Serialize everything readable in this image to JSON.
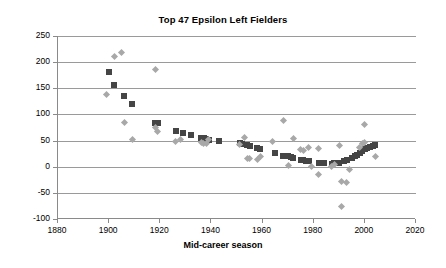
{
  "chart_data": {
    "type": "scatter",
    "title": "Top 47 Epsilon Left Fielders",
    "xlabel": "Mid-career season",
    "ylabel": "",
    "xlim": [
      1880,
      2020
    ],
    "ylim": [
      -100,
      250
    ],
    "xticks": [
      1880,
      1900,
      1920,
      1940,
      1960,
      1980,
      2000,
      2020
    ],
    "yticks": [
      -100,
      -50,
      0,
      50,
      100,
      150,
      200,
      250
    ],
    "grid": "horizontal",
    "legend": "none",
    "colors": {
      "series_squares": "#454545",
      "series_diamonds": "#a8a8a8",
      "gridline": "#9a9a9a",
      "axis": "#8a8a8a",
      "text": "#000000"
    },
    "series": [
      {
        "name": "smoothed-trend",
        "marker": "square",
        "color": "#454545",
        "points": [
          [
            1900,
            182
          ],
          [
            1902,
            157
          ],
          [
            1906,
            136
          ],
          [
            1909,
            120
          ],
          [
            1918,
            84
          ],
          [
            1919,
            83
          ],
          [
            1926,
            68
          ],
          [
            1929,
            64
          ],
          [
            1932,
            60
          ],
          [
            1936,
            55
          ],
          [
            1937,
            54
          ],
          [
            1938,
            53
          ],
          [
            1939,
            52
          ],
          [
            1943,
            50
          ],
          [
            1951,
            45
          ],
          [
            1952,
            44
          ],
          [
            1954,
            41
          ],
          [
            1955,
            40
          ],
          [
            1958,
            35
          ],
          [
            1959,
            34
          ],
          [
            1965,
            26
          ],
          [
            1968,
            21
          ],
          [
            1970,
            20
          ],
          [
            1971,
            18
          ],
          [
            1972,
            17
          ],
          [
            1975,
            13
          ],
          [
            1976,
            12
          ],
          [
            1977,
            11
          ],
          [
            1978,
            10
          ],
          [
            1982,
            8
          ],
          [
            1983,
            8
          ],
          [
            1984,
            7
          ],
          [
            1987,
            6
          ],
          [
            1988,
            7
          ],
          [
            1990,
            8
          ],
          [
            1992,
            10
          ],
          [
            1993,
            12
          ],
          [
            1995,
            17
          ],
          [
            1996,
            20
          ],
          [
            1997,
            23
          ],
          [
            1998,
            27
          ],
          [
            1999,
            30
          ],
          [
            2000,
            33
          ],
          [
            2001,
            35
          ],
          [
            2002,
            38
          ],
          [
            2003,
            40
          ],
          [
            2004,
            41
          ]
        ]
      },
      {
        "name": "raw-values",
        "marker": "diamond",
        "color": "#a8a8a8",
        "points": [
          [
            1899,
            139
          ],
          [
            1902,
            210
          ],
          [
            1905,
            218
          ],
          [
            1906,
            85
          ],
          [
            1909,
            52
          ],
          [
            1918,
            185
          ],
          [
            1918,
            75
          ],
          [
            1919,
            68
          ],
          [
            1926,
            48
          ],
          [
            1928,
            53
          ],
          [
            1936,
            47
          ],
          [
            1937,
            45
          ],
          [
            1938,
            44
          ],
          [
            1939,
            52
          ],
          [
            1951,
            43
          ],
          [
            1953,
            55
          ],
          [
            1954,
            16
          ],
          [
            1955,
            15
          ],
          [
            1958,
            14
          ],
          [
            1959,
            19
          ],
          [
            1964,
            48
          ],
          [
            1968,
            89
          ],
          [
            1970,
            3
          ],
          [
            1972,
            54
          ],
          [
            1975,
            32
          ],
          [
            1976,
            31
          ],
          [
            1978,
            37
          ],
          [
            1979,
            0
          ],
          [
            1982,
            35
          ],
          [
            1982,
            -15
          ],
          [
            1987,
            1
          ],
          [
            1988,
            5
          ],
          [
            1990,
            41
          ],
          [
            1991,
            -77
          ],
          [
            1991,
            -29
          ],
          [
            1993,
            -30
          ],
          [
            1994,
            -5
          ],
          [
            1998,
            36
          ],
          [
            1999,
            44
          ],
          [
            2000,
            81
          ],
          [
            2000,
            46
          ],
          [
            2004,
            19
          ]
        ]
      }
    ]
  },
  "axis": {
    "x_tick_labels": [
      "1880",
      "1900",
      "1920",
      "1940",
      "1960",
      "1980",
      "2000",
      "2020"
    ],
    "y_tick_labels": [
      "250",
      "200",
      "150",
      "100",
      "50",
      "0",
      "-50",
      "-100"
    ]
  }
}
